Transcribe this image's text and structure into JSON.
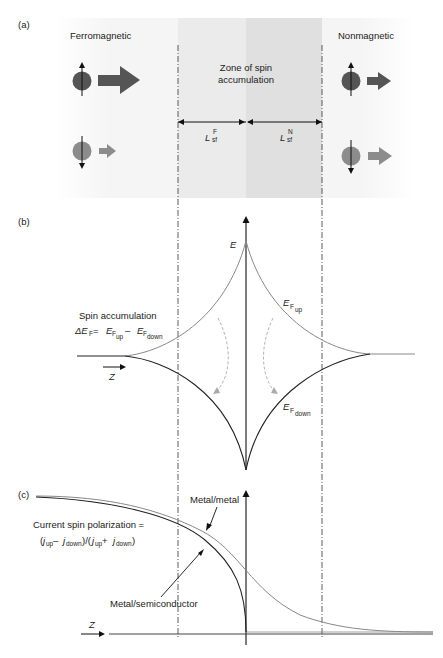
{
  "panels": {
    "a": {
      "label": "(a)",
      "left_title": "Ferromagnetic",
      "right_title": "Nonmagnetic",
      "zone_title_line1": "Zone of spin",
      "zone_title_line2": "accumulation",
      "length_left": {
        "main": "L",
        "sup": "F",
        "sub": "sf"
      },
      "length_right": {
        "main": "L",
        "sup": "N",
        "sub": "sf"
      },
      "colors": {
        "spin_up": "#555555",
        "spin_down": "#8c8c8c",
        "zone_left": "#eeeeee",
        "zone_right": "#e2e2e2",
        "background": "#f6f6f6"
      }
    },
    "b": {
      "label": "(b)",
      "axis_label": "E",
      "ef_up": {
        "main": "E",
        "sub1": "F",
        "sub2": "up"
      },
      "ef_down": {
        "main": "E",
        "sub1": "F",
        "sub2": "down"
      },
      "spin_acc_title": "Spin accumulation",
      "spin_acc_eq": {
        "delta": "ΔE",
        "deltasub": "F",
        "eq": " = ",
        "e1": "E",
        "e1sub": "F",
        "e1subsub": "up",
        "minus": " – ",
        "e2": "E",
        "e2sub": "F",
        "e2subsub": "down"
      },
      "z_label": "Z"
    },
    "c": {
      "label": "(c)",
      "metal_metal": "Metal/metal",
      "metal_semi": "Metal/semiconductor",
      "polarization_line1": "Current spin polarization =",
      "polarization_line2": {
        "open": "(",
        "j": "j",
        "up": "up",
        "minus": " – ",
        "down": "down",
        "mid": ")/(",
        "plus": " + ",
        "close": ")"
      },
      "z_label": "Z"
    }
  }
}
